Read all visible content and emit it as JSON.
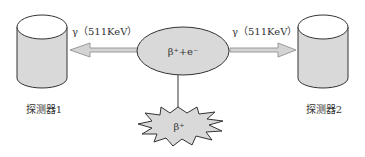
{
  "diagram": {
    "type": "positron-annihilation-detection",
    "colors": {
      "shape_fill": "#d9d9d9",
      "cylinder_top_fill": "#ffffff",
      "stroke": "#333333",
      "arrow_fill": "#d4d4d4",
      "arrow_stroke": "#9a9a9a",
      "text": "#333333"
    },
    "center_node": {
      "label": "β⁺+e⁻"
    },
    "source_node": {
      "label": "β⁺"
    },
    "left_photon": {
      "label": "γ（511KeV）",
      "direction": "left"
    },
    "right_photon": {
      "label": "γ（511KeV）",
      "direction": "right"
    },
    "detectors": [
      {
        "id": "detector-1",
        "label": "探测器1"
      },
      {
        "id": "detector-2",
        "label": "探测器2"
      }
    ]
  }
}
